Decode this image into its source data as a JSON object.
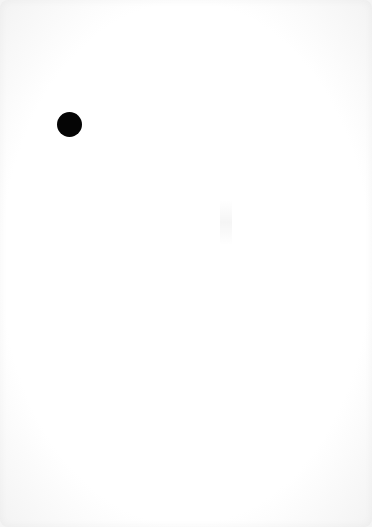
{
  "page": {
    "type": "blank-scanned-page",
    "background_color": "#ffffff",
    "marks": [
      {
        "shape": "circle",
        "color": "#050505",
        "x": 69,
        "y": 124,
        "diameter": 25
      }
    ]
  }
}
